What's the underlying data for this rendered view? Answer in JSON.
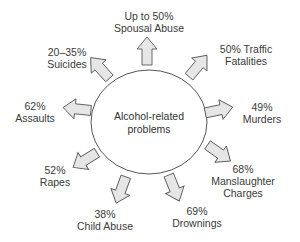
{
  "diagram": {
    "center": {
      "line1": "Alcohol-related",
      "line2": "problems"
    },
    "colors": {
      "arrow_fill": "#e6e6e6",
      "arrow_stroke": "#5a5a5a",
      "circle_stroke": "#555555",
      "text": "#333333"
    },
    "items": [
      {
        "id": "spousal-abuse",
        "percent": "Up to 50%",
        "label": "Spousal Abuse",
        "line1": "Up to 50%",
        "line2": "Spousal Abuse"
      },
      {
        "id": "traffic-fatalities",
        "percent": "50%",
        "label": "Traffic Fatalities",
        "line1": "50% Traffic",
        "line2": "Fatalities"
      },
      {
        "id": "murders",
        "percent": "49%",
        "label": "Murders",
        "line1": "49%",
        "line2": "Murders"
      },
      {
        "id": "manslaughter-charges",
        "percent": "68%",
        "label": "Manslaughter Charges",
        "line1": "68%",
        "line2": "Manslaughter",
        "line3": "Charges"
      },
      {
        "id": "drownings",
        "percent": "69%",
        "label": "Drownings",
        "line1": "69%",
        "line2": "Drownings"
      },
      {
        "id": "child-abuse",
        "percent": "38%",
        "label": "Child Abuse",
        "line1": "38%",
        "line2": "Child Abuse"
      },
      {
        "id": "rapes",
        "percent": "52%",
        "label": "Rapes",
        "line1": "52%",
        "line2": "Rapes"
      },
      {
        "id": "assaults",
        "percent": "62%",
        "label": "Assaults",
        "line1": "62%",
        "line2": "Assaults"
      },
      {
        "id": "suicides",
        "percent": "20–35%",
        "label": "Suicides",
        "line1": "20–35%",
        "line2": "Suicides"
      }
    ]
  }
}
